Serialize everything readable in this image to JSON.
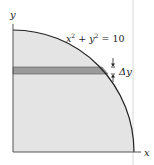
{
  "diagram": {
    "equation_label": "x² + y² = 10",
    "equation_parts": {
      "x": "x",
      "x_exp": "2",
      "plus": "+",
      "y": "y",
      "y_exp": "2",
      "eq": "= 10"
    },
    "delta_label": "Δy",
    "x_axis_label": "x",
    "y_axis_label": "y",
    "colors": {
      "region_fill": "#e4e4e4",
      "strip_fill": "#9a9a9a",
      "curve": "#222222",
      "axis": "#555555",
      "guide_line": "#d8d8d8"
    }
  }
}
